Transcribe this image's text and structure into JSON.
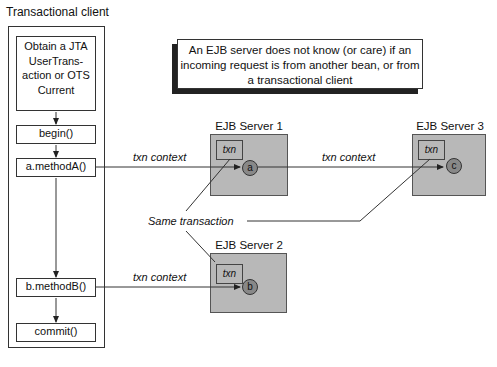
{
  "client": {
    "title": "Transactional client",
    "steps": [
      {
        "label": "Obtain a JTA UserTrans-action or OTS Current"
      },
      {
        "label": "begin()"
      },
      {
        "label": "a.methodA()"
      },
      {
        "label": "b.methodB()"
      },
      {
        "label": "commit()"
      }
    ]
  },
  "note": "An EJB server does not know (or care) if an incoming request is from another bean, or from a transactional client",
  "servers": [
    {
      "title": "EJB Server 1",
      "txn": "txn",
      "bean": "a"
    },
    {
      "title": "EJB Server 2",
      "txn": "txn",
      "bean": "b"
    },
    {
      "title": "EJB Server 3",
      "txn": "txn",
      "bean": "c"
    }
  ],
  "labels": {
    "ctx_a": "txn context",
    "ctx_c": "txn context",
    "ctx_b": "txn context",
    "same": "Same transaction"
  }
}
